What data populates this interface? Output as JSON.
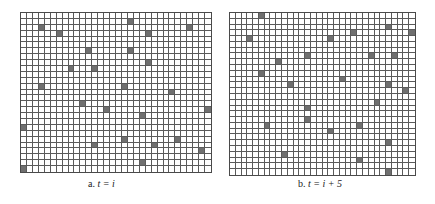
{
  "colors": {
    "background": "#ffffff",
    "grid_line": "#5a5a5a",
    "filled_cell": "#6f6f6f"
  },
  "panels": [
    {
      "id": "a",
      "caption_prefix": "a.",
      "caption_expr": "t = i",
      "cols": 32,
      "rows": 27,
      "box": {
        "left": 20,
        "top": 12,
        "width": 192,
        "height": 161
      },
      "caption_pos": {
        "left": 88,
        "top": 178
      },
      "filled": [
        [
          1,
          18
        ],
        [
          2,
          3
        ],
        [
          2,
          28
        ],
        [
          3,
          6
        ],
        [
          3,
          21
        ],
        [
          6,
          11
        ],
        [
          6,
          18
        ],
        [
          8,
          21
        ],
        [
          9,
          8
        ],
        [
          9,
          12
        ],
        [
          12,
          3
        ],
        [
          12,
          17
        ],
        [
          13,
          25
        ],
        [
          15,
          10
        ],
        [
          16,
          14
        ],
        [
          16,
          31
        ],
        [
          17,
          20
        ],
        [
          19,
          0
        ],
        [
          21,
          17
        ],
        [
          21,
          26
        ],
        [
          22,
          12
        ],
        [
          22,
          22
        ],
        [
          23,
          30
        ],
        [
          25,
          20
        ],
        [
          26,
          0
        ]
      ]
    },
    {
      "id": "b",
      "caption_prefix": "b.",
      "caption_expr": "t = i + 5",
      "cols": 32,
      "rows": 28,
      "box": {
        "left": 229,
        "top": 12,
        "width": 187,
        "height": 164
      },
      "caption_pos": {
        "left": 298,
        "top": 178
      },
      "filled": [
        [
          0,
          5
        ],
        [
          2,
          27
        ],
        [
          3,
          21
        ],
        [
          3,
          31
        ],
        [
          4,
          3
        ],
        [
          4,
          17
        ],
        [
          7,
          13
        ],
        [
          7,
          24
        ],
        [
          7,
          28
        ],
        [
          8,
          8
        ],
        [
          10,
          5
        ],
        [
          11,
          19
        ],
        [
          12,
          10
        ],
        [
          12,
          27
        ],
        [
          13,
          30
        ],
        [
          15,
          25
        ],
        [
          16,
          13
        ],
        [
          18,
          13
        ],
        [
          19,
          6
        ],
        [
          19,
          22
        ],
        [
          20,
          17
        ],
        [
          22,
          27
        ],
        [
          24,
          9
        ],
        [
          25,
          22
        ],
        [
          27,
          27
        ]
      ]
    }
  ]
}
